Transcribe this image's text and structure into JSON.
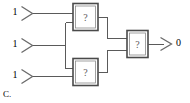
{
  "figure": {
    "caption": "C.",
    "type": "logic-circuit-diagram",
    "colors": {
      "wire": "#5a5a5a",
      "gate_border": "#4a4a4a",
      "text": "#5c5c5c",
      "background": "#ffffff"
    }
  },
  "inputs": [
    {
      "id": "input-1",
      "label": "1",
      "symbol": "buffer-arrow"
    },
    {
      "id": "input-2",
      "label": "1",
      "symbol": "buffer-arrow"
    },
    {
      "id": "input-3",
      "label": "1",
      "symbol": "buffer-arrow"
    }
  ],
  "gates": [
    {
      "id": "gate-top",
      "label": "?"
    },
    {
      "id": "gate-bottom",
      "label": "?"
    },
    {
      "id": "gate-output",
      "label": "?"
    }
  ],
  "outputs": [
    {
      "id": "output-1",
      "label": "0",
      "symbol": "arrow"
    }
  ]
}
